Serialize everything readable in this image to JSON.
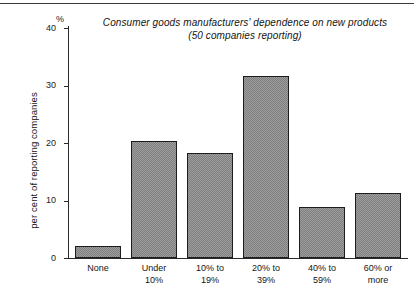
{
  "chart_data": {
    "type": "bar",
    "title": "Consumer goods manufacturers' dependence on new products",
    "subtitle": "(50 companies reporting)",
    "xlabel": "",
    "ylabel": "per cent of reporting companies",
    "yunit": "%",
    "ylim": [
      0,
      40
    ],
    "yticks": [
      0,
      10,
      20,
      30,
      40
    ],
    "ytick_labels": [
      "0",
      "10",
      "20",
      "30",
      "40"
    ],
    "grid": false,
    "legend": false,
    "categories": [
      "None",
      "Under 10%",
      "10% to 19%",
      "20% to 39%",
      "40% to 59%",
      "60% or more"
    ],
    "category_lines": [
      [
        "None",
        ""
      ],
      [
        "Under",
        "10%"
      ],
      [
        "10% to",
        "19%"
      ],
      [
        "20% to",
        "39%"
      ],
      [
        "40% to",
        "59%"
      ],
      [
        "60% or",
        "more"
      ]
    ],
    "values": [
      2.1,
      20.4,
      18.3,
      31.6,
      8.9,
      11.3
    ],
    "bar_fill": "#9e9e9e",
    "bar_border": "#1c1c1c",
    "axis_color": "#2b2b2b"
  }
}
